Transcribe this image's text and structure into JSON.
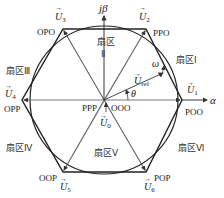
{
  "diagram": {
    "type": "svpwm-space-vector-hexagon",
    "axes": {
      "alpha": "α",
      "beta": "jβ"
    },
    "center_states": {
      "left": "PPP",
      "right": "OOO"
    },
    "zero_vector": {
      "symbol": "U",
      "sub": "0"
    },
    "reference_vector": {
      "symbol": "U",
      "sub": "ref",
      "omega": "ω",
      "theta": "θ"
    },
    "vectors": [
      {
        "symbol": "U",
        "sub": "1",
        "state": "POO"
      },
      {
        "symbol": "U",
        "sub": "2",
        "state": "PPO"
      },
      {
        "symbol": "U",
        "sub": "3",
        "state": "OPO"
      },
      {
        "symbol": "U",
        "sub": "4",
        "state": "OPP"
      },
      {
        "symbol": "U",
        "sub": "5",
        "state": "OOP"
      },
      {
        "symbol": "U",
        "sub": "6",
        "state": "POP"
      }
    ],
    "sectors": [
      {
        "label": "扇区Ⅰ"
      },
      {
        "label_top": "扇区",
        "label_bottom": "Ⅱ"
      },
      {
        "label": "扇区Ⅲ"
      },
      {
        "label": "扇区Ⅳ"
      },
      {
        "label": "扇区Ⅴ"
      },
      {
        "label": "扇区Ⅵ"
      }
    ],
    "colors": {
      "line": "#222222",
      "thin": "#555555",
      "background": "#ffffff"
    }
  }
}
